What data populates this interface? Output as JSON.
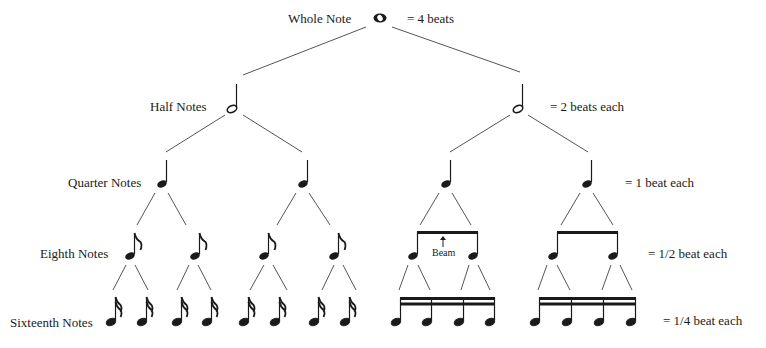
{
  "diagram": {
    "levels": [
      {
        "id": "whole",
        "label": "Whole Note",
        "value_text": "= 4 beats",
        "count": 1
      },
      {
        "id": "half",
        "label": "Half Notes",
        "value_text": "= 2 beats each",
        "count": 2
      },
      {
        "id": "quarter",
        "label": "Quarter Notes",
        "value_text": "= 1 beat each",
        "count": 4
      },
      {
        "id": "eighth",
        "label": "Eighth Notes",
        "value_text": "= 1/2 beat each",
        "count": 8
      },
      {
        "id": "sixteenth",
        "label": "Sixteenth Notes",
        "value_text": "= 1/4 beat each",
        "count": 16
      }
    ],
    "annotation": {
      "text": "Beam",
      "arrow": "up-arrow"
    },
    "colors": {
      "ink": "#1a1a1a",
      "line": "#444444",
      "background": "#ffffff"
    }
  }
}
